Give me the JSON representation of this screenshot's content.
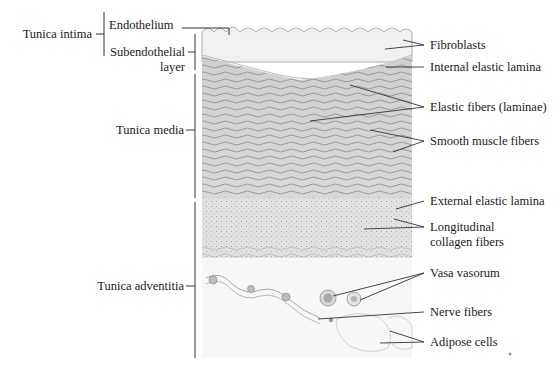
{
  "diagram": {
    "left_labels": {
      "tunica_intima": "Tunica intima",
      "endothelium": "Endothelium",
      "subendothelial_line1": "Subendothelial",
      "subendothelial_line2": "layer",
      "tunica_media": "Tunica media",
      "tunica_adventitia": "Tunica adventitia"
    },
    "right_labels": {
      "fibroblasts": "Fibroblasts",
      "internal_elastic_lamina": "Internal elastic lamina",
      "elastic_fibers": "Elastic fibers (laminae)",
      "smooth_muscle": "Smooth muscle fibers",
      "external_elastic_lamina": "External elastic lamina",
      "collagen_line1": "Longitudinal",
      "collagen_line2": "collagen fibers",
      "vasa_vasorum": "Vasa vasorum",
      "nerve_fibers": "Nerve fibers",
      "adipose_cells": "Adipose cells"
    }
  }
}
